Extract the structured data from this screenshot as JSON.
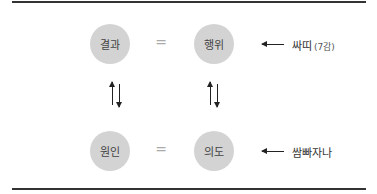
{
  "diagram": {
    "top_row": {
      "left_node": "결과",
      "equals": "=",
      "right_node": "행위",
      "annotation": "싸띠",
      "annotation_sub": "(7감)"
    },
    "bottom_row": {
      "left_node": "원인",
      "equals": "=",
      "right_node": "의도",
      "annotation": "쌈빠자나"
    }
  }
}
